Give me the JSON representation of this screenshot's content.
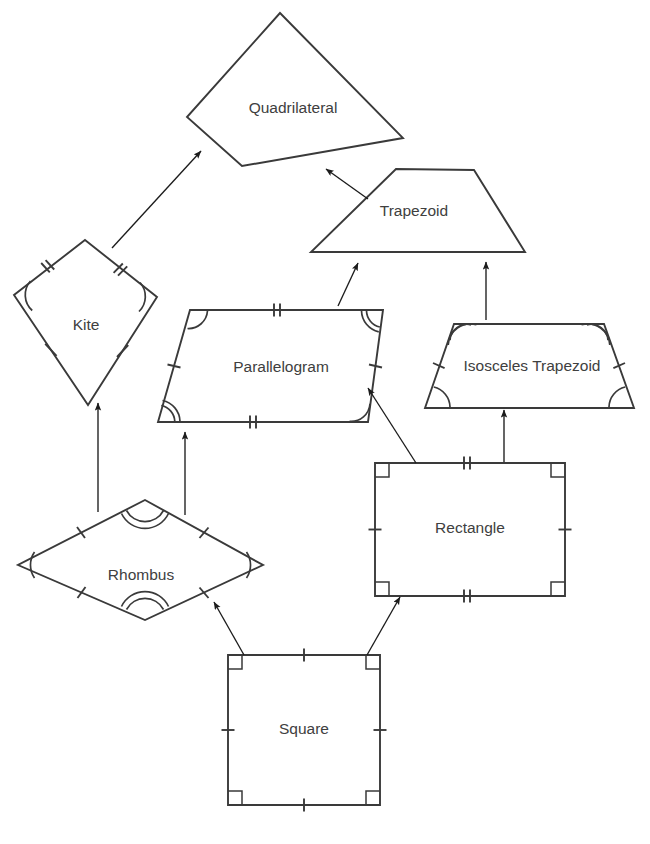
{
  "diagram": {
    "type": "hierarchy-diagram",
    "background_color": "#ffffff",
    "stroke_color": "#3a3a3a",
    "label_color": "#404040",
    "guide_color": "#c8c8c8",
    "arrow_color": "#1c1c1c"
  },
  "shapes": {
    "quadrilateral": {
      "label": "Quadrilateral",
      "label_x": 293,
      "label_y": 109,
      "points": "280,13 403,138 242,166 187,117",
      "marks": []
    },
    "kite": {
      "label": "Kite",
      "label_x": 86,
      "label_y": 326,
      "points": "85,240 157,297 88,405 14,295",
      "marks": [
        "two-pairs-equal-sides",
        "one-pair-equal-angles",
        "perpendicular-diagonals"
      ]
    },
    "trapezoid": {
      "label": "Trapezoid",
      "label_x": 414,
      "label_y": 212,
      "points": "396,169 474,170 525,252 311,252",
      "marks": [
        "height-with-right-angle"
      ]
    },
    "parallelogram": {
      "label": "Parallelogram",
      "label_x": 281,
      "label_y": 368,
      "points": "190,310 383,310 368,422 158,422",
      "marks": [
        "two-pairs-parallel-sides",
        "opposite-angles-equal",
        "height-with-right-angle"
      ]
    },
    "isosceles_trapezoid": {
      "label": "Isosceles Trapezoid",
      "label_x": 532,
      "label_y": 367,
      "points": "454,324 604,324 634,408 425,408",
      "marks": [
        "equal-legs",
        "base-angles-equal",
        "height-with-right-angle"
      ]
    },
    "rhombus": {
      "label": "Rhombus",
      "label_x": 141,
      "label_y": 576,
      "points": "145,500 263,565 145,620 18,565",
      "marks": [
        "four-equal-sides",
        "opposite-angles-equal",
        "perpendicular-diagonals"
      ]
    },
    "rectangle": {
      "label": "Rectangle",
      "label_x": 470,
      "label_y": 529,
      "points": "375,463 565,463 565,596 375,596",
      "marks": [
        "four-right-angles",
        "opposite-sides-equal"
      ]
    },
    "square": {
      "label": "Square",
      "label_x": 304,
      "label_y": 730,
      "points": "228,655 380,655 380,805 228,805",
      "marks": [
        "four-right-angles",
        "four-equal-sides"
      ]
    }
  },
  "connections": [
    {
      "name": "kite-to-quadrilateral",
      "from": "kite",
      "to": "quadrilateral"
    },
    {
      "name": "trapezoid-to-quadrilateral",
      "from": "trapezoid",
      "to": "quadrilateral"
    },
    {
      "name": "parallelogram-to-trapezoid",
      "from": "parallelogram",
      "to": "trapezoid"
    },
    {
      "name": "isosceles-trapezoid-to-trapezoid",
      "from": "isosceles_trapezoid",
      "to": "trapezoid"
    },
    {
      "name": "rhombus-to-kite",
      "from": "rhombus",
      "to": "kite"
    },
    {
      "name": "rhombus-to-parallelogram",
      "from": "rhombus",
      "to": "parallelogram"
    },
    {
      "name": "rectangle-to-parallelogram",
      "from": "rectangle",
      "to": "parallelogram"
    },
    {
      "name": "rectangle-to-isosceles-trapezoid",
      "from": "rectangle",
      "to": "isosceles_trapezoid"
    },
    {
      "name": "square-to-rhombus",
      "from": "square",
      "to": "rhombus"
    },
    {
      "name": "square-to-rectangle",
      "from": "square",
      "to": "rectangle"
    }
  ]
}
